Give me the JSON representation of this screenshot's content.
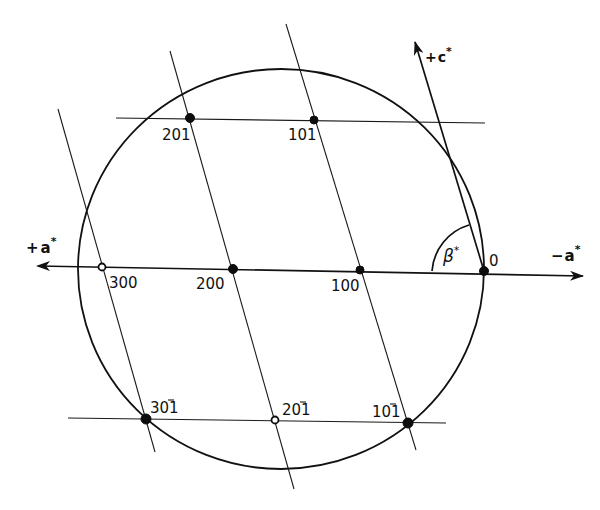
{
  "figure": {
    "type": "reciprocal-lattice-construction",
    "axes": {
      "plus_a": {
        "sign": "+",
        "symbol": "a",
        "star": "*"
      },
      "minus_a": {
        "sign": "−",
        "symbol": "a",
        "star": "*"
      },
      "plus_c": {
        "sign": "+",
        "symbol": "c",
        "star": "*"
      }
    },
    "angle": {
      "symbol": "β",
      "star": "*"
    },
    "origin": {
      "label": "0"
    },
    "points": {
      "p201": {
        "label": "201",
        "marker": "filled"
      },
      "p101": {
        "label": "101",
        "marker": "filled"
      },
      "p300": {
        "label": "300",
        "marker": "open"
      },
      "p200": {
        "label": "200",
        "marker": "filled"
      },
      "p100": {
        "label": "100",
        "marker": "filled"
      },
      "p30m1": {
        "label_main": "30",
        "label_bar": "1",
        "marker": "filled"
      },
      "p20m1": {
        "label_main": "20",
        "label_bar": "1",
        "marker": "open"
      },
      "p10m1": {
        "label_main": "10",
        "label_bar": "1",
        "marker": "filled"
      }
    },
    "colors": {
      "ink": "#111111",
      "paper": "#ffffff"
    }
  }
}
